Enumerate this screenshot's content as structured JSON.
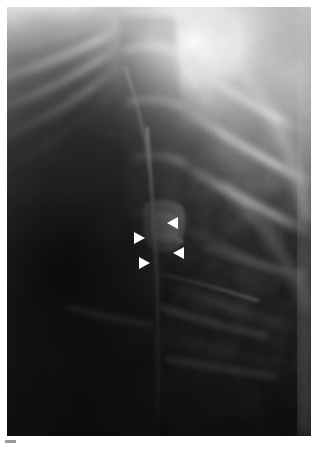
{
  "figure": {
    "modality": "chest-radiograph",
    "view": "coned-down lateral chest detail",
    "region_label": "",
    "caption": "",
    "tick_mark_label": "",
    "background_color": "#ffffff",
    "plate_bounds": {
      "x": 7,
      "y": 7,
      "width": 304,
      "height": 429
    }
  },
  "annotations": {
    "marker_type": "arrowhead",
    "marker_color": "#fdfdfb",
    "count": 4,
    "markers": [
      {
        "id": "arrowhead-upper-right",
        "direction": "left",
        "x": 167,
        "y": 217,
        "note": "superior aspect of lesion"
      },
      {
        "id": "arrowhead-upper-left",
        "direction": "right",
        "x": 134,
        "y": 232,
        "note": "lateral aspect of lesion"
      },
      {
        "id": "arrowhead-lower-right",
        "direction": "left",
        "x": 173,
        "y": 247,
        "note": "inferior-medial aspect of lesion"
      },
      {
        "id": "arrowhead-lower-left",
        "direction": "right",
        "x": 139,
        "y": 257,
        "note": "inferior-lateral aspect of lesion"
      }
    ]
  },
  "image_content": {
    "description": "Grayscale chest radiograph detail. Dark lung field occupies the left and lower portion; bright overexposed soft-tissue / apical region in the upper right. Oblique rib shadows cross the field from upper-left to lower-right. A vertical linear bright density (fissure / vessel) runs down the mid field. Four white arrowheads converge on a central lesion.",
    "tonal_range": {
      "darkest": "#0a0a0a",
      "midtone": "#7e7e7e",
      "brightest": "#fdfdfd"
    },
    "grain": "fine film grain, scanned print"
  },
  "chart_data": {
    "type": "heatmap",
    "title": "",
    "xlabel": "",
    "ylabel": "",
    "grid": false,
    "legend": "none",
    "colormap": "grayscale"
  }
}
